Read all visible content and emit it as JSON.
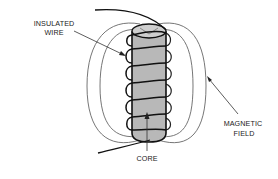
{
  "labels": {
    "insulated_wire": [
      "INSULATED",
      "WIRE"
    ],
    "magnetic_field": [
      "MAGNETIC",
      "FIELD"
    ],
    "core": "CORE"
  },
  "colors": {
    "core_fill": "#b8b8b8",
    "core_top": "#cfcfcf",
    "wire": "#111111",
    "field_lines": "#666666",
    "text": "#222222",
    "background": "#ffffff"
  },
  "components": {
    "coil_turns": 6,
    "field_loops_per_side": 2
  }
}
